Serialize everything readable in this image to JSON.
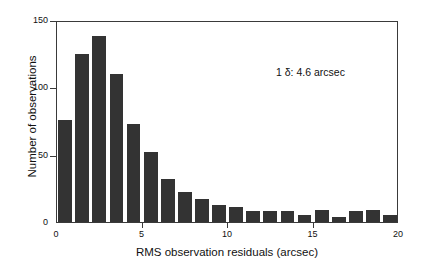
{
  "chart_data": {
    "type": "bar",
    "title": "",
    "subtitle": "",
    "xlabel": "RMS observation residuals (arcsec)",
    "ylabel": "Number of observations",
    "xlim": [
      0,
      20
    ],
    "ylim": [
      0,
      150
    ],
    "xticks": [
      0,
      5,
      10,
      15,
      20
    ],
    "xtick_labels": [
      "0",
      "5",
      "10",
      "15",
      "20"
    ],
    "yticks": [
      0,
      50,
      100,
      150
    ],
    "ytick_labels": [
      "0",
      "50",
      "100",
      "150"
    ],
    "grid": false,
    "legend": null,
    "bin_width": 1,
    "bar_color": "#333333",
    "categories": [
      "0-1",
      "1-2",
      "2-3",
      "3-4",
      "4-5",
      "5-6",
      "6-7",
      "7-8",
      "8-9",
      "9-10",
      "10-11",
      "11-12",
      "12-13",
      "13-14",
      "14-15",
      "15-16",
      "16-17",
      "17-18",
      "18-19",
      "19-20"
    ],
    "bin_starts": [
      0,
      1,
      2,
      3,
      4,
      5,
      6,
      7,
      8,
      9,
      10,
      11,
      12,
      13,
      14,
      15,
      16,
      17,
      18,
      19
    ],
    "values": [
      76,
      125,
      138,
      110,
      73,
      52,
      32,
      22,
      17,
      13,
      11,
      8,
      8,
      8,
      5,
      9,
      4,
      8,
      9,
      5
    ],
    "annotations": [
      {
        "text": "1 δ: 4.6 arcsec",
        "x": 12.9,
        "y": 117
      }
    ]
  },
  "annotation": {
    "text": "1 δ: 4.6 arcsec"
  },
  "axes": {
    "x_title": "RMS observation residuals (arcsec)",
    "y_title": "Number of observations"
  }
}
